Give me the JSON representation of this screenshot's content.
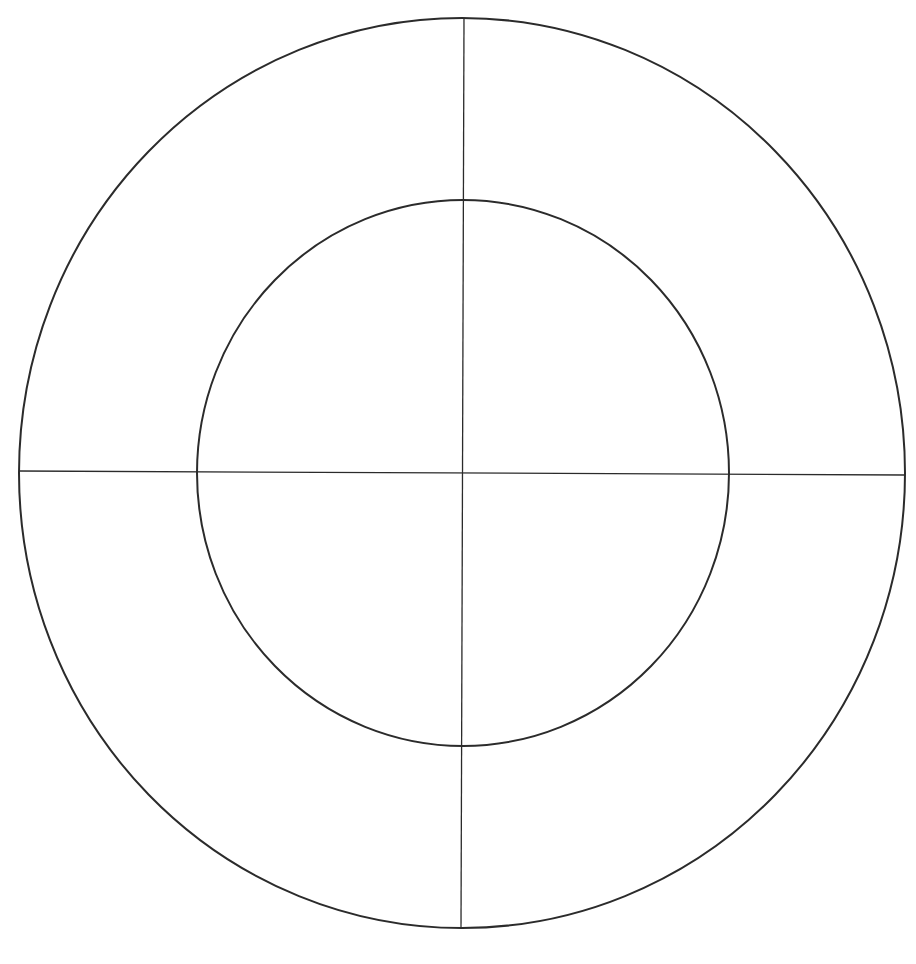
{
  "diagram": {
    "type": "concentric-circles-with-crosshair",
    "background": "#ffffff",
    "stroke_color": "#2b2b2b",
    "outer_circle": {
      "cx": 462,
      "cy": 473,
      "rx": 443,
      "ry": 455,
      "stroke_width": 2
    },
    "inner_circle": {
      "cx": 463,
      "cy": 473,
      "rx": 266,
      "ry": 273,
      "stroke_width": 2
    },
    "vertical_line": {
      "x1": 464,
      "y1": 18,
      "x2": 461,
      "y2": 929,
      "stroke_width": 1.3
    },
    "horizontal_line": {
      "x1": 19,
      "y1": 471,
      "x2": 905,
      "y2": 475,
      "stroke_width": 1.3
    },
    "regions": [
      {
        "id": "inner-top-left",
        "label": ""
      },
      {
        "id": "inner-top-right",
        "label": ""
      },
      {
        "id": "inner-bottom-left",
        "label": ""
      },
      {
        "id": "inner-bottom-right",
        "label": ""
      },
      {
        "id": "outer-ring-top-left",
        "label": ""
      },
      {
        "id": "outer-ring-top-right",
        "label": ""
      },
      {
        "id": "outer-ring-bottom-left",
        "label": ""
      },
      {
        "id": "outer-ring-bottom-right",
        "label": ""
      }
    ]
  }
}
